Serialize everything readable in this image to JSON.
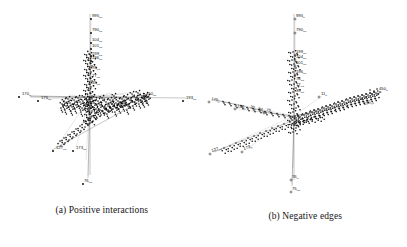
{
  "figure": {
    "background": "#ffffff",
    "ink_color": "#101010",
    "panels": [
      {
        "id": "panel-a",
        "caption": "(a) Positive interactions",
        "plot_type": "3d-network-scatter",
        "description": "Three-dimensional node-link layout of a signed interaction network; dense core cluster with sparse labelled outliers along three projected axes.",
        "labels": [
          {
            "text": "995",
            "sub": "out",
            "x": 92,
            "y": 17
          },
          {
            "text": "790",
            "sub": "out",
            "x": 92,
            "y": 31
          },
          {
            "text": "104",
            "sub": "out",
            "x": 92,
            "y": 41
          },
          {
            "text": "101",
            "sub": "out",
            "x": 92,
            "y": 47
          },
          {
            "text": "199",
            "sub": "out",
            "x": 92,
            "y": 55
          },
          {
            "text": "196",
            "sub": "out",
            "x": 92,
            "y": 59
          },
          {
            "text": "78",
            "sub": "out",
            "x": 92,
            "y": 69
          },
          {
            "text": "77",
            "sub": "out",
            "x": 92,
            "y": 77
          },
          {
            "text": "39",
            "sub": "out",
            "x": 92,
            "y": 84
          },
          {
            "text": "170",
            "sub": "in",
            "x": 22,
            "y": 95
          },
          {
            "text": "175",
            "sub": "out",
            "x": 41,
            "y": 99
          },
          {
            "text": "450",
            "sub": "out",
            "x": 146,
            "y": 95
          },
          {
            "text": "193",
            "sub": "out",
            "x": 186,
            "y": 99
          },
          {
            "text": "127",
            "sub": "out",
            "x": 56,
            "y": 149
          },
          {
            "text": "173",
            "sub": "out",
            "x": 76,
            "y": 149
          },
          {
            "text": "76",
            "sub": "out",
            "x": 84,
            "y": 182
          }
        ]
      },
      {
        "id": "panel-b",
        "caption": "(b) Negative edges",
        "plot_type": "3d-network-scatter",
        "description": "Three-dimensional node-link layout of the negative-edge subgraph; dense diagonal band with labelled outliers on the in and out axes.",
        "labels": [
          {
            "text": "995",
            "sub": "in",
            "x": 92,
            "y": 17
          },
          {
            "text": "790",
            "sub": "out",
            "x": 92,
            "y": 31
          },
          {
            "text": "199",
            "sub": "out",
            "x": 92,
            "y": 53
          },
          {
            "text": "104",
            "sub": "out",
            "x": 92,
            "y": 58
          },
          {
            "text": "101",
            "sub": "out",
            "x": 92,
            "y": 64
          },
          {
            "text": "196",
            "sub": "out",
            "x": 92,
            "y": 73
          },
          {
            "text": "78",
            "sub": "out",
            "x": 92,
            "y": 80
          },
          {
            "text": "77",
            "sub": "out",
            "x": 92,
            "y": 86
          },
          {
            "text": "39",
            "sub": "out",
            "x": 92,
            "y": 92
          },
          {
            "text": "11",
            "sub": "in",
            "x": 117,
            "y": 95
          },
          {
            "text": "170",
            "sub": "in",
            "x": 7,
            "y": 100
          },
          {
            "text": "125",
            "sub": "in",
            "x": 33,
            "y": 107
          },
          {
            "text": "20",
            "sub": "in",
            "x": 46,
            "y": 108
          },
          {
            "text": "84",
            "sub": "in",
            "x": 54,
            "y": 110
          },
          {
            "text": "75",
            "sub": "in",
            "x": 62,
            "y": 111
          },
          {
            "text": "450",
            "sub": "in",
            "x": 175,
            "y": 90
          },
          {
            "text": "193",
            "sub": "out",
            "x": 160,
            "y": 105
          },
          {
            "text": "127",
            "sub": "out",
            "x": 8,
            "y": 152
          },
          {
            "text": "173",
            "sub": "in",
            "x": 40,
            "y": 150
          },
          {
            "text": "76",
            "sub": "in",
            "x": 88,
            "y": 178
          },
          {
            "text": "75",
            "sub": "out",
            "x": 88,
            "y": 190
          }
        ]
      }
    ]
  }
}
